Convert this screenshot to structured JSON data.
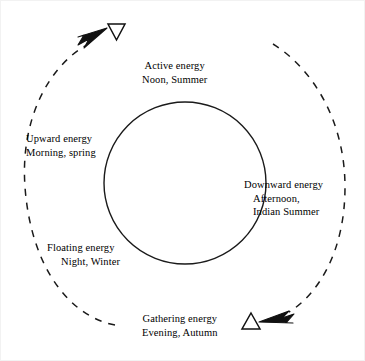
{
  "diagram": {
    "colors": {
      "stroke": "#1a1a1a",
      "background": "#ffffff",
      "border": "#f2f2f2"
    },
    "inner_circle": {
      "name": "inner-circle",
      "center_x": 184,
      "center_y": 182,
      "radius": 81,
      "style": "solid"
    },
    "outer_arcs": [
      {
        "name": "left-dashed-arc",
        "description": "dashed arc sweeping up the left side, ending in an arrowhead at top-left",
        "style": "dashed"
      },
      {
        "name": "right-dashed-arc",
        "description": "dashed arc sweeping down the right side, ending in an arrowhead at bottom-right",
        "style": "dashed"
      }
    ],
    "markers": [
      {
        "name": "yin-triangle-down",
        "glyph": "triangle-down",
        "filled": false,
        "x": 115,
        "y": 30
      },
      {
        "name": "yang-triangle-up",
        "glyph": "triangle-up",
        "filled": false,
        "x": 250,
        "y": 321
      },
      {
        "name": "arrowhead-up-left",
        "glyph": "arrowhead",
        "filled": true,
        "direction": "up-right"
      },
      {
        "name": "arrowhead-down-right",
        "glyph": "arrowhead",
        "filled": true,
        "direction": "down-left"
      }
    ],
    "labels": {
      "active": {
        "name": "label-active-energy",
        "line1": "Active energy",
        "line2": "Noon, Summer"
      },
      "upward": {
        "name": "label-upward-energy",
        "line1": "Upward energy",
        "line2": "Morning, spring"
      },
      "downward": {
        "name": "label-downward-energy",
        "line1": "Downward energy",
        "line2": "Afternoon,",
        "line3": "Indian Summer"
      },
      "floating": {
        "name": "label-floating-energy",
        "line1": "Floating energy",
        "line2": "Night, Winter"
      },
      "gathering": {
        "name": "label-gathering-energy",
        "line1": "Gathering energy",
        "line2": "Evening, Autumn"
      }
    }
  }
}
